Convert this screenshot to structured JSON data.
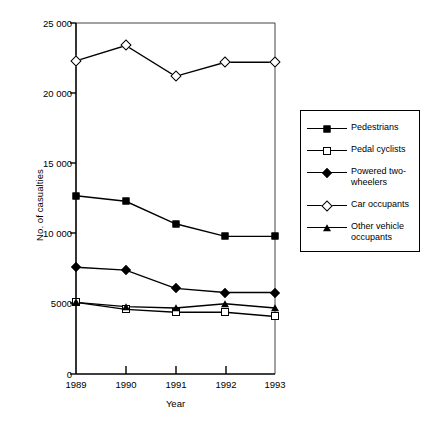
{
  "chart_data": {
    "type": "line",
    "title": "",
    "xlabel": "Year",
    "ylabel": "No. of casualties",
    "x": [
      "1989",
      "1990",
      "1991",
      "1992",
      "1993"
    ],
    "categories": [
      "1989",
      "1990",
      "1991",
      "1992",
      "1993"
    ],
    "xlim": [
      1989,
      1993
    ],
    "ylim": [
      0,
      25000
    ],
    "ytick_values": [
      0,
      5000,
      10000,
      15000,
      20000,
      25000
    ],
    "ytick_labels": [
      "0",
      "5000",
      "10 000",
      "15 000",
      "20 000",
      "25 000"
    ],
    "grid": false,
    "legend_position": "right",
    "series": [
      {
        "name": "Pedestrians",
        "marker": "filled-square",
        "values": [
          12700,
          12300,
          10700,
          9800,
          9800
        ]
      },
      {
        "name": "Pedal cyclists",
        "marker": "open-square",
        "values": [
          5100,
          4600,
          4400,
          4400,
          4100
        ]
      },
      {
        "name": "Powered two-wheelers",
        "marker": "filled-diamond",
        "values": [
          7600,
          7400,
          6100,
          5800,
          5800
        ]
      },
      {
        "name": "Car occupants",
        "marker": "open-diamond",
        "values": [
          22300,
          23400,
          21200,
          22200,
          22200
        ]
      },
      {
        "name": "Other vehicle occupants",
        "marker": "filled-triangle",
        "values": [
          5100,
          4800,
          4700,
          5000,
          4700
        ]
      }
    ]
  },
  "legend": {
    "entries": [
      {
        "label": "Pedestrians",
        "label_line2": ""
      },
      {
        "label": "Pedal cyclists",
        "label_line2": ""
      },
      {
        "label": "Powered two-",
        "label_line2": "wheelers"
      },
      {
        "label": "Car occupants",
        "label_line2": ""
      },
      {
        "label": "Other vehicle",
        "label_line2": "occupants"
      }
    ]
  },
  "colors": {
    "line": "#000000",
    "axis": "#000000",
    "background": "#ffffff"
  }
}
